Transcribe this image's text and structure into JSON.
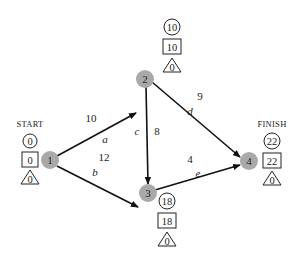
{
  "diagram": {
    "type": "activity-network",
    "nodes": [
      {
        "id": "1",
        "label": "1",
        "caption": "START",
        "earliest": "0",
        "latest": "0",
        "float": "0"
      },
      {
        "id": "2",
        "label": "2",
        "caption": "",
        "earliest": "10",
        "latest": "10",
        "float": "0"
      },
      {
        "id": "3",
        "label": "3",
        "caption": "",
        "earliest": "18",
        "latest": "18",
        "float": "0"
      },
      {
        "id": "4",
        "label": "4",
        "caption": "FINISH",
        "earliest": "22",
        "latest": "22",
        "float": "0"
      }
    ],
    "edges": [
      {
        "from": "1",
        "to": "2",
        "activity": "a",
        "duration": "10"
      },
      {
        "from": "1",
        "to": "3",
        "activity": "b",
        "duration": "12"
      },
      {
        "from": "2",
        "to": "3",
        "activity": "c",
        "duration": "8"
      },
      {
        "from": "2",
        "to": "4",
        "activity": "d",
        "duration": "9"
      },
      {
        "from": "3",
        "to": "4",
        "activity": "e",
        "duration": "4"
      }
    ],
    "colors": {
      "node_fill": "#a9a9a9",
      "edge": "#111111",
      "text": "#222222"
    }
  }
}
